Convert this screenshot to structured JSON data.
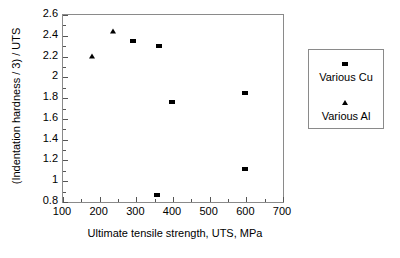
{
  "chart_data": {
    "type": "scatter",
    "title": "",
    "xlabel": "Ultimate tensile strength, UTS, MPa",
    "ylabel": "(Indentation hardness / 3) / UTS",
    "xlim": [
      100,
      700
    ],
    "ylim": [
      0.8,
      2.6
    ],
    "xticks": [
      100,
      200,
      300,
      400,
      500,
      600,
      700
    ],
    "xtick_labels": [
      "100",
      "200",
      "300",
      "400",
      "500",
      "600",
      "700"
    ],
    "yticks": [
      0.8,
      1,
      1.2,
      1.4,
      1.6,
      1.8,
      2,
      2.2,
      2.4,
      2.6
    ],
    "ytick_labels": [
      "0.8",
      "1",
      "1.2",
      "1.4",
      "1.6",
      "1.8",
      "2",
      "2.2",
      "2.4",
      "2.6"
    ],
    "x_minor_tick_step": 50,
    "y_minor_tick_step": 0.1,
    "grid": false,
    "legend_position": "right-outside",
    "series": [
      {
        "name": "Various Cu",
        "marker": "square",
        "color": "#000000",
        "points": [
          {
            "x": 290,
            "y": 2.35
          },
          {
            "x": 362,
            "y": 2.3
          },
          {
            "x": 397,
            "y": 1.765
          },
          {
            "x": 355,
            "y": 0.865
          },
          {
            "x": 595,
            "y": 1.845
          },
          {
            "x": 595,
            "y": 1.12
          }
        ]
      },
      {
        "name": "Various Al",
        "marker": "triangle",
        "color": "#000000",
        "points": [
          {
            "x": 180,
            "y": 2.21
          },
          {
            "x": 235,
            "y": 2.45
          }
        ]
      }
    ]
  },
  "legend": {
    "entries": [
      {
        "label": "Various Cu",
        "marker": "square"
      },
      {
        "label": "Various Al",
        "marker": "triangle"
      }
    ]
  }
}
